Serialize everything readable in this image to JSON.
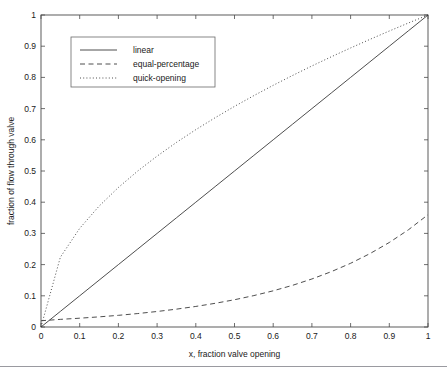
{
  "chart_data": {
    "type": "line",
    "title": "",
    "xlabel": "x, fraction valve opening",
    "ylabel": "fraction of flow through valve",
    "xlim": [
      0,
      1
    ],
    "ylim": [
      0,
      1
    ],
    "grid": false,
    "legend_position": "upper-left-inset",
    "xticks": [
      "0",
      "0.1",
      "0.2",
      "0.3",
      "0.4",
      "0.5",
      "0.6",
      "0.7",
      "0.8",
      "0.9",
      "1"
    ],
    "xtick_values": [
      0,
      0.1,
      0.2,
      0.3,
      0.4,
      0.5,
      0.6,
      0.7,
      0.8,
      0.9,
      1
    ],
    "yticks": [
      "0",
      "0.1",
      "0.2",
      "0.3",
      "0.4",
      "0.5",
      "0.6",
      "0.7",
      "0.8",
      "0.9",
      "1"
    ],
    "ytick_values": [
      0,
      0.1,
      0.2,
      0.3,
      0.4,
      0.5,
      0.6,
      0.7,
      0.8,
      0.9,
      1
    ],
    "x": [
      0,
      0.05,
      0.1,
      0.15,
      0.2,
      0.25,
      0.3,
      0.35,
      0.4,
      0.45,
      0.5,
      0.55,
      0.6,
      0.65,
      0.7,
      0.75,
      0.8,
      0.85,
      0.9,
      0.95,
      1
    ],
    "series": [
      {
        "name": "linear",
        "style": "solid",
        "values": [
          0,
          0.05,
          0.1,
          0.15,
          0.2,
          0.25,
          0.3,
          0.35,
          0.4,
          0.45,
          0.5,
          0.55,
          0.6,
          0.65,
          0.7,
          0.75,
          0.8,
          0.85,
          0.9,
          0.95,
          1
        ]
      },
      {
        "name": "equal-percentage",
        "style": "dashed",
        "values": [
          0.02,
          0.0245,
          0.0282,
          0.0325,
          0.0374,
          0.0431,
          0.0497,
          0.0572,
          0.0659,
          0.0759,
          0.0874,
          0.1007,
          0.116,
          0.1336,
          0.1539,
          0.1773,
          0.2042,
          0.2352,
          0.2709,
          0.3121,
          0.36
        ]
      },
      {
        "name": "quick-opening",
        "style": "dotted",
        "values": [
          0,
          0.2236,
          0.3162,
          0.3873,
          0.4472,
          0.5,
          0.5477,
          0.5916,
          0.6325,
          0.6708,
          0.7071,
          0.7416,
          0.7746,
          0.8062,
          0.8367,
          0.866,
          0.8944,
          0.9219,
          0.9487,
          0.9747,
          1
        ]
      }
    ]
  },
  "legend": {
    "entries": [
      {
        "label": "linear",
        "style": "solid"
      },
      {
        "label": "equal-percentage",
        "style": "dashed"
      },
      {
        "label": "quick-opening",
        "style": "dotted"
      }
    ]
  },
  "colors": {
    "background": "#ffffff",
    "axis": "#4a4a4a",
    "curve": "#3a3a3a",
    "text": "#1a1a1a",
    "footer_rule": "#9a9aa0"
  }
}
